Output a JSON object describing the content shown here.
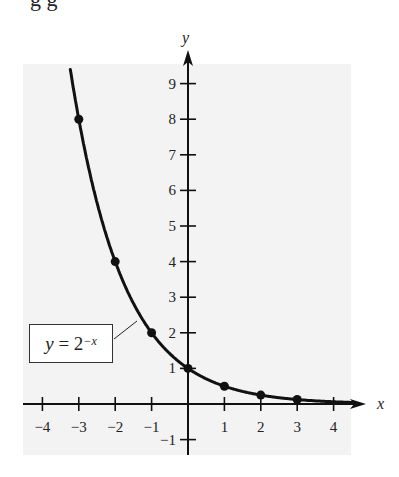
{
  "caption_fragment": "g          g",
  "chart_data": {
    "type": "line",
    "title": "",
    "function": "y = 2^(-x)",
    "annotation": {
      "lhs": "y",
      "eq": " = ",
      "base": "2",
      "exponent": "−x"
    },
    "xlabel": "x",
    "ylabel": "y",
    "xlim": [
      -4.5,
      4.8
    ],
    "ylim": [
      -1.4,
      9.8
    ],
    "x_ticks": [
      -4,
      -3,
      -2,
      -1,
      1,
      2,
      3,
      4
    ],
    "x_tick_labels": [
      "−4",
      "−3",
      "−2",
      "−1",
      "1",
      "2",
      "3",
      "4"
    ],
    "y_ticks": [
      -1,
      1,
      2,
      3,
      4,
      5,
      6,
      7,
      8,
      9
    ],
    "y_tick_labels": [
      "−1",
      "1",
      "2",
      "3",
      "4",
      "5",
      "6",
      "7",
      "8",
      "9"
    ],
    "grid": false,
    "legend": null,
    "series": [
      {
        "name": "y = 2^-x",
        "x": [
          -3,
          -2,
          -1,
          0,
          1,
          2,
          3
        ],
        "values": [
          8,
          4,
          2,
          1,
          0.5,
          0.25,
          0.125
        ],
        "marked_points": true
      }
    ]
  },
  "colors": {
    "panel": "#f3f3f3",
    "ink": "#111111"
  }
}
